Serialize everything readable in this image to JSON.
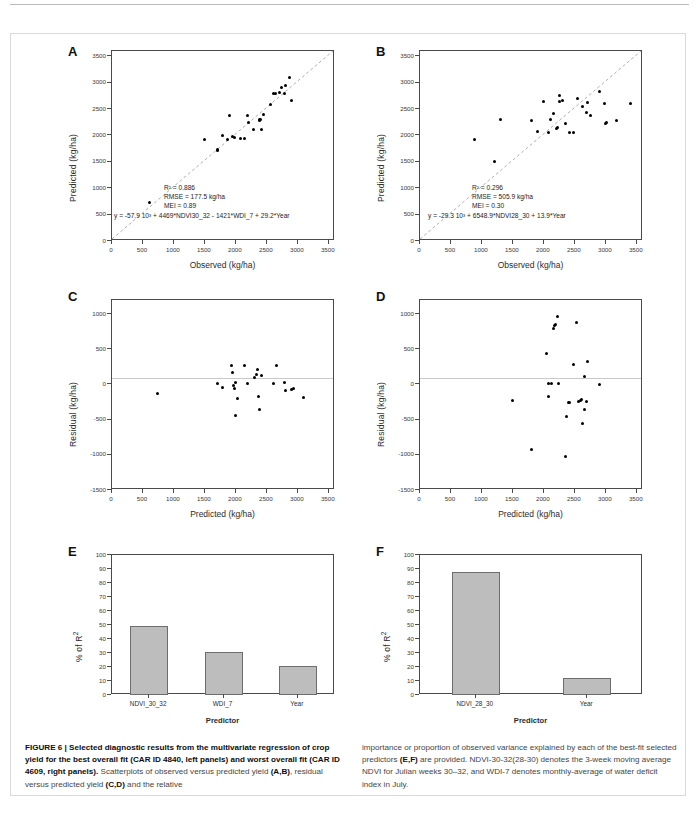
{
  "figure": {
    "caption_left_bold": "FIGURE 6 | Selected diagnostic results from the multivariate regression of crop yield for the best overall fit (CAR ID 4840, left panels) and worst overall fit (CAR ID 4609, right panels).",
    "caption_left_rest": " Scatterplots of observed versus predicted yield ",
    "caption_left_ab": "(A,B)",
    "caption_left_rest2": ", residual versus predicted yield ",
    "caption_left_cd": "(C,D)",
    "caption_left_rest3": " and the relative",
    "caption_right_1": "importance or proportion of observed variance explained by each of the best-fit selected predictors ",
    "caption_right_ef": "(E,F)",
    "caption_right_2": " are provided. NDVI-30-32(28-30) denotes the 3-week moving average NDVI for Julian weeks 30–32, and WDI-7 denotes monthly-average of water deficit index in July."
  },
  "axes": {
    "yield_ticks": [
      "0",
      "500",
      "1000",
      "1500",
      "2000",
      "2500",
      "3000",
      "3500"
    ],
    "residual_ticks": [
      "1000",
      "500",
      "0",
      "-500",
      "-1000",
      "-1500"
    ],
    "percent_ticks": [
      "0",
      "10",
      "20",
      "30",
      "40",
      "50",
      "60",
      "70",
      "80",
      "90",
      "100"
    ],
    "observed_label": "Observed (kg/ha)",
    "predicted_label": "Predicted (kg/ha)",
    "residual_label": "Residual (kg/ha)",
    "percent_label": "% of R²",
    "predictor_label": "Predictor"
  },
  "chart_data": [
    {
      "panel": "A",
      "letter": "A",
      "type": "scatter",
      "title": "",
      "xlabel": "Observed (kg/ha)",
      "ylabel": "Predicted (kg/ha)",
      "xlim": [
        0,
        3600
      ],
      "ylim": [
        0,
        3600
      ],
      "grid": false,
      "reference_line": "1:1 dashed",
      "annotations": [
        "R² = 0.886",
        "RMSE = 177.5 kg/ha",
        "MEI = 0.89",
        "y = -57.9 10³ + 4469*NDVI30_32  - 1421*WDI_7  + 29.2*Year"
      ],
      "points": [
        [
          600,
          730
        ],
        [
          1500,
          1930
        ],
        [
          1700,
          1710
        ],
        [
          1700,
          1730
        ],
        [
          1790,
          2000
        ],
        [
          1870,
          1930
        ],
        [
          1900,
          2375
        ],
        [
          1950,
          1975
        ],
        [
          1980,
          1970
        ],
        [
          2080,
          1935
        ],
        [
          2140,
          1935
        ],
        [
          2180,
          2375
        ],
        [
          2200,
          2240
        ],
        [
          2280,
          2120
        ],
        [
          2380,
          2290
        ],
        [
          2380,
          2300
        ],
        [
          2390,
          2310
        ],
        [
          2420,
          2120
        ],
        [
          2440,
          2400
        ],
        [
          2560,
          2595
        ],
        [
          2600,
          2800
        ],
        [
          2640,
          2800
        ],
        [
          2700,
          2805
        ],
        [
          2730,
          2900
        ],
        [
          2790,
          2800
        ],
        [
          2800,
          2950
        ],
        [
          2860,
          3105
        ],
        [
          2900,
          2660
        ]
      ]
    },
    {
      "panel": "B",
      "letter": "B",
      "type": "scatter",
      "title": "",
      "xlabel": "Observed (kg/ha)",
      "ylabel": "Predicted (kg/ha)",
      "xlim": [
        0,
        3600
      ],
      "ylim": [
        0,
        3600
      ],
      "grid": false,
      "reference_line": "1:1 dashed",
      "annotations": [
        "R² = 0.296",
        "RMSE = 505.9 kg/ha",
        "MEI = 0.30",
        "y = -29.3 10³ + 6548.9*NDVI28_30  + 13.9*Year"
      ],
      "points": [
        [
          880,
          1930
        ],
        [
          1200,
          1500
        ],
        [
          1300,
          2300
        ],
        [
          1800,
          2280
        ],
        [
          1900,
          2075
        ],
        [
          2000,
          2650
        ],
        [
          2080,
          2050
        ],
        [
          2100,
          2300
        ],
        [
          2150,
          2420
        ],
        [
          2200,
          2140
        ],
        [
          2220,
          2160
        ],
        [
          2250,
          2750
        ],
        [
          2260,
          2640
        ],
        [
          2300,
          2660
        ],
        [
          2350,
          2220
        ],
        [
          2420,
          2060
        ],
        [
          2480,
          2050
        ],
        [
          2540,
          2700
        ],
        [
          2620,
          2550
        ],
        [
          2680,
          2440
        ],
        [
          2700,
          2620
        ],
        [
          2760,
          2370
        ],
        [
          2900,
          2830
        ],
        [
          2980,
          2610
        ],
        [
          3000,
          2230
        ],
        [
          3010,
          2240
        ],
        [
          3180,
          2290
        ],
        [
          3400,
          2600
        ]
      ]
    },
    {
      "panel": "C",
      "letter": "C",
      "type": "scatter",
      "xlabel": "Predicted (kg/ha)",
      "ylabel": "Residual (kg/ha)",
      "xlim": [
        0,
        3600
      ],
      "ylim": [
        -1500,
        1200
      ],
      "grid": false,
      "reference_line": "y = 0",
      "points": [
        [
          730,
          -130
        ],
        [
          1700,
          15
        ],
        [
          1780,
          -40
        ],
        [
          1930,
          270
        ],
        [
          1950,
          175
        ],
        [
          1960,
          -20
        ],
        [
          1970,
          -60
        ],
        [
          1990,
          30
        ],
        [
          1990,
          -440
        ],
        [
          2020,
          -195
        ],
        [
          2140,
          275
        ],
        [
          2180,
          20
        ],
        [
          2300,
          105
        ],
        [
          2330,
          145
        ],
        [
          2350,
          215
        ],
        [
          2370,
          -165
        ],
        [
          2380,
          -360
        ],
        [
          2420,
          130
        ],
        [
          2600,
          10
        ],
        [
          2650,
          265
        ],
        [
          2780,
          25
        ],
        [
          2800,
          -80
        ],
        [
          2900,
          -70
        ],
        [
          2930,
          -55
        ],
        [
          3090,
          -180
        ]
      ]
    },
    {
      "panel": "D",
      "letter": "D",
      "type": "scatter",
      "xlabel": "Predicted (kg/ha)",
      "ylabel": "Residual (kg/ha)",
      "xlim": [
        0,
        3600
      ],
      "ylim": [
        -1500,
        1200
      ],
      "grid": false,
      "reference_line": "y = 0",
      "points": [
        [
          1500,
          -230
        ],
        [
          1800,
          -930
        ],
        [
          2050,
          440
        ],
        [
          2070,
          -170
        ],
        [
          2080,
          20
        ],
        [
          2130,
          10
        ],
        [
          2160,
          790
        ],
        [
          2170,
          840
        ],
        [
          2180,
          855
        ],
        [
          2220,
          960
        ],
        [
          2230,
          15
        ],
        [
          2350,
          -1030
        ],
        [
          2370,
          -450
        ],
        [
          2390,
          -250
        ],
        [
          2420,
          -260
        ],
        [
          2470,
          290
        ],
        [
          2530,
          880
        ],
        [
          2560,
          -240
        ],
        [
          2590,
          -230
        ],
        [
          2600,
          -220
        ],
        [
          2620,
          -560
        ],
        [
          2650,
          120
        ],
        [
          2660,
          -360
        ],
        [
          2680,
          -240
        ],
        [
          2700,
          320
        ],
        [
          2900,
          5
        ]
      ]
    },
    {
      "panel": "E",
      "letter": "E",
      "type": "bar",
      "xlabel": "Predictor",
      "ylabel": "% of R²",
      "categories": [
        "NDVI_30_32",
        "WDI_7",
        "Year"
      ],
      "values": [
        49,
        31,
        20.5
      ],
      "ylim": [
        0,
        100
      ],
      "grid": false
    },
    {
      "panel": "F",
      "letter": "F",
      "type": "bar",
      "xlabel": "Predictor",
      "ylabel": "% of R²",
      "categories": [
        "NDVI_28_30",
        "Year"
      ],
      "values": [
        88,
        12
      ],
      "ylim": [
        0,
        100
      ],
      "grid": false
    }
  ]
}
